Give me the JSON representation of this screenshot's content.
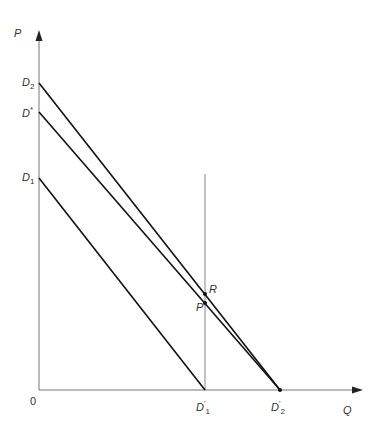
{
  "figure": {
    "axes": {
      "y_label": "P",
      "x_label": "Q",
      "origin_label": "0"
    },
    "intercepts_y": [
      {
        "name": "D",
        "sub": "2",
        "sup": ""
      },
      {
        "name": "D",
        "sub": "",
        "sup": "*"
      },
      {
        "name": "D",
        "sub": "1",
        "sup": ""
      }
    ],
    "intercepts_x": [
      {
        "name": "D",
        "sub": "1",
        "sup": "'"
      },
      {
        "name": "D",
        "sub": "2",
        "sup": "'"
      }
    ],
    "points": [
      {
        "name": "R"
      },
      {
        "name": "P"
      }
    ],
    "lines": [
      {
        "from": "D2",
        "to": "D2'"
      },
      {
        "from": "D*",
        "to": "D2'"
      },
      {
        "from": "D1",
        "to": "D1'"
      },
      {
        "vertical_at": "D1'"
      }
    ]
  }
}
